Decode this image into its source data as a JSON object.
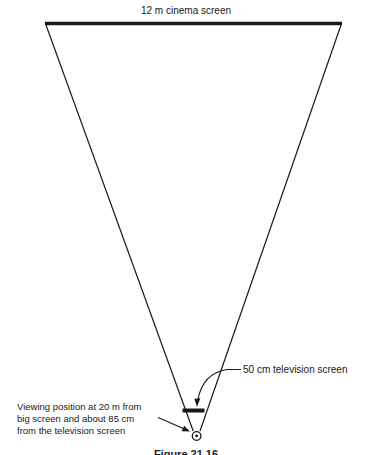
{
  "diagram": {
    "top_label": "12 m cinema screen",
    "tv_label": "50 cm television screen",
    "viewing_label_lines": [
      "Viewing position at 20 m from",
      "big screen and about 85 cm",
      "from the television screen"
    ],
    "caption": "Figure 21.16",
    "colors": {
      "ink": "#1a1a1a",
      "background": "#ffffff"
    }
  }
}
